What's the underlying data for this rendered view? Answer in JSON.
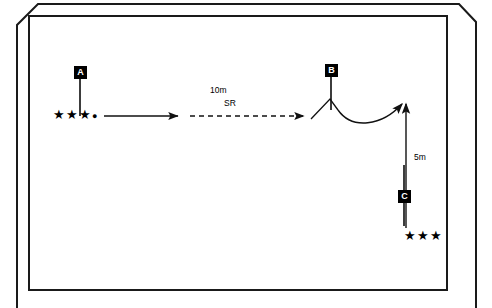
{
  "diagram": {
    "background_color": "#ffffff",
    "line_color": "#1a1a1a",
    "markers": [
      {
        "id": "A",
        "label": "A",
        "x": 74,
        "y": 66
      },
      {
        "id": "B",
        "label": "B",
        "x": 325,
        "y": 64
      },
      {
        "id": "C",
        "label": "C",
        "x": 398,
        "y": 190
      }
    ],
    "labels": [
      {
        "id": "distance-10m",
        "text": "10m",
        "x": 210,
        "y": 85
      },
      {
        "id": "label-sr",
        "text": "SR",
        "x": 224,
        "y": 98
      },
      {
        "id": "distance-5m",
        "text": "5m",
        "x": 414,
        "y": 152
      }
    ],
    "player_groups": [
      {
        "id": "group-a",
        "stars": "★★★",
        "dot": "●",
        "x": 53,
        "y": 108
      },
      {
        "id": "group-c",
        "stars": "★★★",
        "dot": "",
        "x": 404,
        "y": 229
      }
    ],
    "paths": {
      "run_solid": "M 104,116 L 176,116",
      "run_dashed": "M 188,116 L 302,116",
      "zigzag": "M 310,118 L 329,100 L 337,108",
      "curve": "M 337,108 C 352,128 382,124 402,103",
      "vertical": "M 406,228 L 406,106"
    }
  }
}
